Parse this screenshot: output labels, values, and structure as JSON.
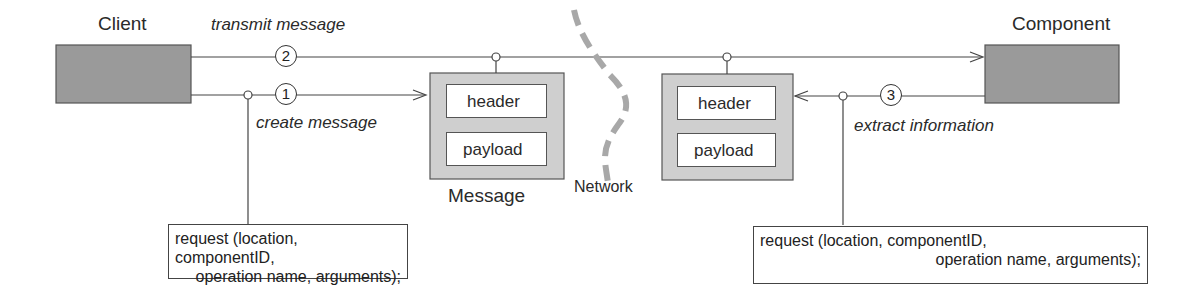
{
  "diagram": {
    "client": {
      "label": "Client"
    },
    "component": {
      "label": "Component"
    },
    "steps": [
      {
        "number": "1",
        "label": "create message"
      },
      {
        "number": "2",
        "label": "transmit message"
      },
      {
        "number": "3",
        "label": "extract information"
      }
    ],
    "message_left": {
      "caption": "Message",
      "fields": [
        "header",
        "payload"
      ]
    },
    "message_right": {
      "fields": [
        "header",
        "payload"
      ]
    },
    "network": {
      "label": "Network"
    },
    "request_left": {
      "line1": "request (location, componentID,",
      "line2": "operation name, arguments);"
    },
    "request_right": {
      "line1": "request (location, componentID,",
      "line2": "operation name, arguments);"
    },
    "colors": {
      "block_fill": "#9a9a9a",
      "message_fill": "#cfcfcf",
      "network_dash": "#a8a8a8",
      "line": "#444444"
    }
  }
}
